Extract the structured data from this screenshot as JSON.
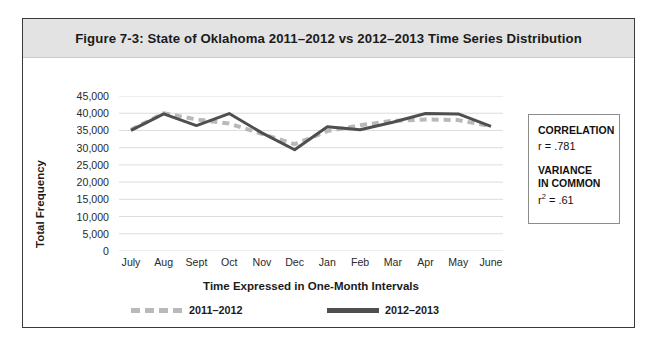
{
  "figure": {
    "title": "Figure 7-3: State of Oklahoma 2011–2012 vs 2012–2013 Time Series Distribution"
  },
  "axes": {
    "y_title": "Total Frequency",
    "x_title": "Time Expressed in One-Month Intervals"
  },
  "stats": {
    "correlation_heading": "CORRELATION",
    "correlation_value": "r = .781",
    "variance_heading_line1": "VARIANCE",
    "variance_heading_line2": "IN COMMON",
    "variance_value_prefix": "r",
    "variance_value_exp": "2",
    "variance_value_rest": " = .61"
  },
  "chart_data": {
    "type": "line",
    "title": "Figure 7-3: State of Oklahoma 2011–2012 vs 2012–2013 Time Series Distribution",
    "xlabel": "Time Expressed in One-Month Intervals",
    "ylabel": "Total Frequency",
    "categories": [
      "July",
      "Aug",
      "Sept",
      "Oct",
      "Nov",
      "Dec",
      "Jan",
      "Feb",
      "Mar",
      "Apr",
      "May",
      "June"
    ],
    "ylim": [
      0,
      45000
    ],
    "ytick_labels": [
      "45,000",
      "40,000",
      "35,000",
      "30,000",
      "25,000",
      "20,000",
      "15,000",
      "10,000",
      "5,000",
      "0"
    ],
    "ytick_values": [
      45000,
      40000,
      35000,
      30000,
      25000,
      20000,
      15000,
      10000,
      5000,
      0
    ],
    "grid": true,
    "legend_position": "bottom",
    "series": [
      {
        "name": "2011–2012",
        "style": "dashed",
        "color": "#b9b9b9",
        "values": [
          35200,
          40000,
          38200,
          37000,
          34000,
          31000,
          34800,
          36500,
          37800,
          38200,
          38000,
          36200
        ]
      },
      {
        "name": "2012–2013",
        "style": "solid",
        "color": "#4f4f4f",
        "values": [
          35000,
          39800,
          36400,
          39900,
          34300,
          29400,
          36100,
          35200,
          37400,
          39900,
          39800,
          36200
        ]
      }
    ]
  }
}
